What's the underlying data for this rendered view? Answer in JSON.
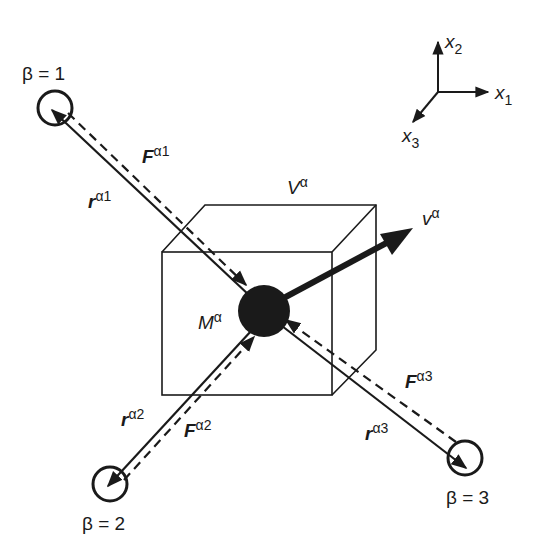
{
  "figure": {
    "colors": {
      "ink": "#1a1a1a",
      "background": "#ffffff"
    }
  },
  "axes": {
    "x1": {
      "base": "x",
      "sub": "1"
    },
    "x2": {
      "base": "x",
      "sub": "2"
    },
    "x3": {
      "base": "x",
      "sub": "3"
    }
  },
  "particle_alpha": {
    "mass": {
      "base": "M",
      "sup": "α"
    },
    "volume": {
      "base": "V",
      "sup": "α"
    },
    "velocity": {
      "base": "v",
      "sup": "α"
    }
  },
  "neighbors": [
    {
      "label": "β = 1",
      "position_vector": {
        "base": "r",
        "sup": "α1"
      },
      "force": {
        "base": "F",
        "sup": "α1"
      }
    },
    {
      "label": "β = 2",
      "position_vector": {
        "base": "r",
        "sup": "α2"
      },
      "force": {
        "base": "F",
        "sup": "α2"
      }
    },
    {
      "label": "β = 3",
      "position_vector": {
        "base": "r",
        "sup": "α3"
      },
      "force": {
        "base": "F",
        "sup": "α3"
      }
    }
  ]
}
